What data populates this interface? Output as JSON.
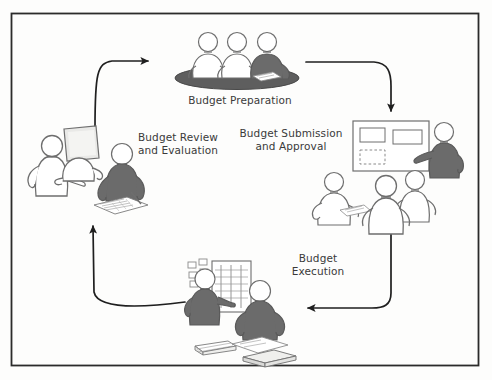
{
  "diagram": {
    "frame": {
      "border_color": "#2b2b2b",
      "background": "#fdfdfc"
    },
    "palette": {
      "outline": "#6e6e6e",
      "dark_figure": "#6b6b6b",
      "light_figure": "#ffffff",
      "table_dark": "#5e5e5e",
      "arrow": "#1f1f1f",
      "text": "#3a3a3a",
      "paper": "#efefed"
    },
    "stages": [
      {
        "id": "budget-preparation",
        "label": "Budget Preparation",
        "position": "top",
        "scene": "three people seated around a dark oval meeting table, right figure shaded dark"
      },
      {
        "id": "budget-submission-and-approval",
        "label": "Budget Submission\nand Approval",
        "position": "right",
        "scene": "dark presenter pointing at a whiteboard with two rectangles and a dashed rectangle, three light figures in the audience, one holding papers"
      },
      {
        "id": "budget-execution",
        "label": "Budget\nExecution",
        "position": "bottom",
        "scene": "dark figure pointing at a bar-chart flipchart with sticky notes, seated dark figure with stacks of paper and books"
      },
      {
        "id": "budget-review-and-evaluation",
        "label": "Budget Review\nand Evaluation",
        "position": "left",
        "scene": "two light figures at a computer monitor and a dark figure writing on a spreadsheet document"
      }
    ],
    "arrows": [
      {
        "id": "arrow-review-to-preparation",
        "from": "budget-review-and-evaluation",
        "to": "budget-preparation",
        "direction": "right"
      },
      {
        "id": "arrow-preparation-to-submission",
        "from": "budget-preparation",
        "to": "budget-submission-and-approval",
        "direction": "down"
      },
      {
        "id": "arrow-submission-to-execution",
        "from": "budget-submission-and-approval",
        "to": "budget-execution",
        "direction": "left"
      },
      {
        "id": "arrow-execution-to-review",
        "from": "budget-execution",
        "to": "budget-review-and-evaluation",
        "direction": "up"
      }
    ]
  }
}
